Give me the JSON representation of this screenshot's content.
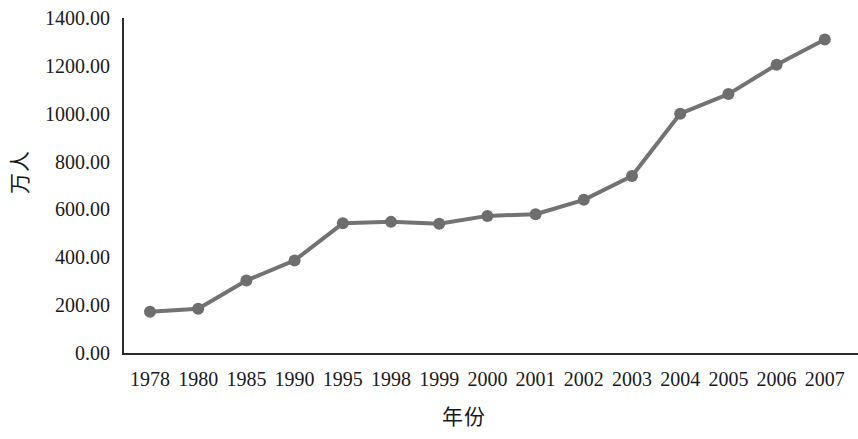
{
  "chart_data": {
    "type": "line",
    "title": "",
    "xlabel": "年份",
    "ylabel": "万人",
    "categories": [
      "1978",
      "1980",
      "1985",
      "1990",
      "1995",
      "1998",
      "1999",
      "2000",
      "2001",
      "2002",
      "2003",
      "2004",
      "2005",
      "2006",
      "2007"
    ],
    "values": [
      172.0,
      185.0,
      303.0,
      387.0,
      542.0,
      548.0,
      540.0,
      573.0,
      580.0,
      640.0,
      740.0,
      1000.0,
      1082.0,
      1205.0,
      1310.0
    ],
    "series": [
      {
        "name": "万人",
        "values": [
          172.0,
          185.0,
          303.0,
          387.0,
          542.0,
          548.0,
          540.0,
          573.0,
          580.0,
          640.0,
          740.0,
          1000.0,
          1082.0,
          1205.0,
          1310.0
        ]
      }
    ],
    "ylim": [
      0,
      1400
    ],
    "ytick_step": 200,
    "ytick_labels": [
      "0.00",
      "200.00",
      "400.00",
      "600.00",
      "800.00",
      "1000.00",
      "1200.00",
      "1400.00"
    ],
    "ytick_values": [
      0,
      200,
      400,
      600,
      800,
      1000,
      1200,
      1400
    ],
    "grid": false,
    "legend": "none",
    "marker": "circle",
    "colors": {
      "line": "#737373",
      "marker": "#6e6e6e",
      "axis": "#2b2b2b",
      "text": "#1a1a1a",
      "background": "#ffffff"
    }
  }
}
